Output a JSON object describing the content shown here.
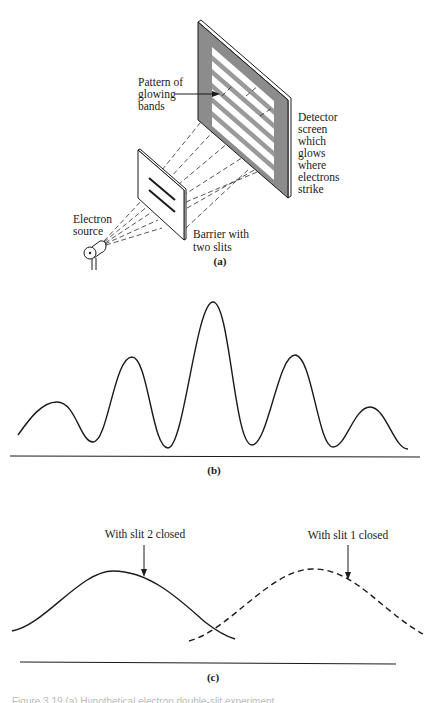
{
  "panel_a": {
    "panel_label": "(a)",
    "pattern_label": [
      "Pattern of",
      "glowing",
      "bands"
    ],
    "detector_label": [
      "Detector",
      "screen",
      "which",
      "glows",
      "where",
      "electrons",
      "strike"
    ],
    "barrier_label": [
      "Barrier with",
      "two slits"
    ],
    "source_label": [
      "Electron",
      "source"
    ],
    "colors": {
      "screen_gray": "#8c8c8c",
      "band_gray": "#9a9a9a",
      "ink": "#1a1a1a"
    }
  },
  "panel_b": {
    "panel_label": "(b)",
    "description": "Interference pattern of electron intensity across detector screen"
  },
  "panel_c": {
    "panel_label": "(c)",
    "curve_1_label": "With slit 2 closed",
    "curve_2_label": "With slit 1 closed"
  },
  "caption": "Figure 3.19 (a) Hypothetical electron double-slit experiment"
}
